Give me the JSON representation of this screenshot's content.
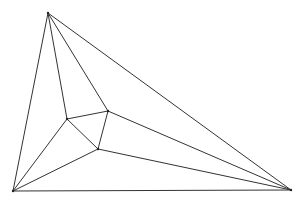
{
  "diagram": {
    "type": "planar-graph",
    "stroke_color": "#333333",
    "background": "#ffffff",
    "vertices": [
      {
        "id": "T",
        "x": 48,
        "y": 13
      },
      {
        "id": "BL",
        "x": 13,
        "y": 191
      },
      {
        "id": "BR",
        "x": 291,
        "y": 190
      },
      {
        "id": "A",
        "x": 67,
        "y": 119
      },
      {
        "id": "B",
        "x": 108,
        "y": 111
      },
      {
        "id": "C",
        "x": 98,
        "y": 149
      }
    ],
    "edges": [
      [
        "T",
        "BL"
      ],
      [
        "T",
        "BR"
      ],
      [
        "BL",
        "BR"
      ],
      [
        "T",
        "A"
      ],
      [
        "T",
        "B"
      ],
      [
        "A",
        "B"
      ],
      [
        "A",
        "C"
      ],
      [
        "B",
        "C"
      ],
      [
        "BL",
        "A"
      ],
      [
        "BL",
        "C"
      ],
      [
        "B",
        "BR"
      ],
      [
        "C",
        "BR"
      ]
    ]
  }
}
